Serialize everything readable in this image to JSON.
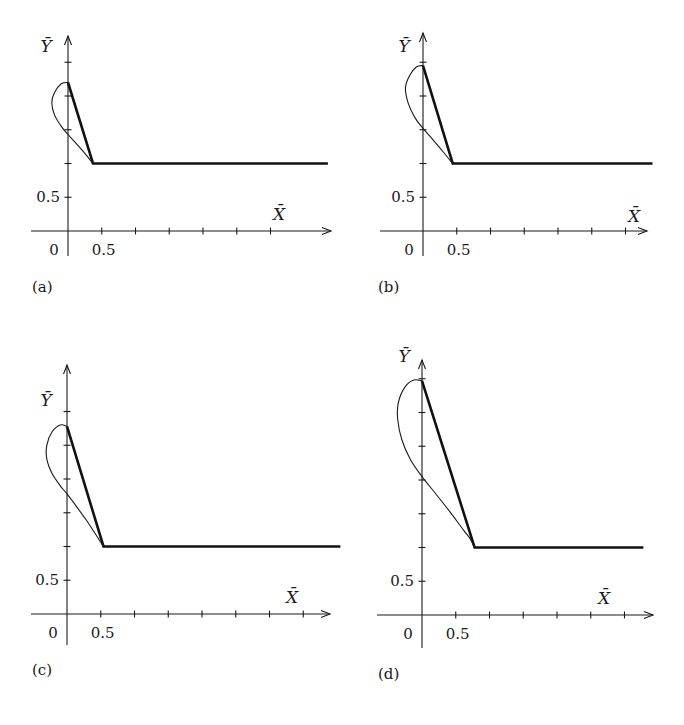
{
  "figure": {
    "panels_count": 4
  },
  "chart_data": [
    {
      "type": "line",
      "panel_label": "(a)",
      "xlabel": "X̄",
      "ylabel": "Ȳ",
      "x_tick_label": "0.5",
      "y_tick_label": "0.5",
      "origin_label": "0",
      "x_ticks": [
        0.5,
        1.0,
        1.5,
        2.0,
        2.5,
        3.0
      ],
      "y_ticks": [
        0.5,
        1.0,
        1.5,
        2.0,
        2.5
      ],
      "xlim": [
        -0.55,
        3.85
      ],
      "ylim": [
        -0.38,
        2.88
      ],
      "series": [
        {
          "name": "piecewise-linear (thick)",
          "points": [
            [
              0,
              2.2
            ],
            [
              0.37,
              1.0
            ],
            [
              3.85,
              1.0
            ]
          ]
        },
        {
          "name": "loop curve (thin)",
          "points": [
            [
              0,
              2.2
            ],
            [
              -0.1,
              2.18
            ],
            [
              -0.2,
              2.05
            ],
            [
              -0.24,
              1.9
            ],
            [
              -0.2,
              1.72
            ],
            [
              -0.1,
              1.55
            ],
            [
              0,
              1.43
            ],
            [
              0.12,
              1.3
            ],
            [
              0.25,
              1.15
            ],
            [
              0.37,
              1.0
            ]
          ]
        }
      ]
    },
    {
      "type": "line",
      "panel_label": "(b)",
      "xlabel": "X̄",
      "ylabel": "Ȳ",
      "x_tick_label": "0.5",
      "y_tick_label": "0.5",
      "origin_label": "0",
      "x_ticks": [
        0.5,
        1.0,
        1.5,
        2.0,
        2.5,
        3.0
      ],
      "y_ticks": [
        0.5,
        1.0,
        1.5,
        2.0,
        2.5
      ],
      "xlim": [
        -0.63,
        3.45
      ],
      "ylim": [
        -0.38,
        2.88
      ],
      "series": [
        {
          "name": "piecewise-linear (thick)",
          "points": [
            [
              0,
              2.45
            ],
            [
              0.44,
              1.0
            ],
            [
              3.4,
              1.0
            ]
          ]
        },
        {
          "name": "loop curve (thin)",
          "points": [
            [
              0,
              2.45
            ],
            [
              -0.1,
              2.43
            ],
            [
              -0.2,
              2.3
            ],
            [
              -0.26,
              2.12
            ],
            [
              -0.22,
              1.9
            ],
            [
              -0.12,
              1.68
            ],
            [
              0,
              1.52
            ],
            [
              0.15,
              1.35
            ],
            [
              0.3,
              1.17
            ],
            [
              0.44,
              1.0
            ]
          ]
        }
      ]
    },
    {
      "type": "line",
      "panel_label": "(c)",
      "xlabel": "X̄",
      "ylabel": "Ȳ",
      "x_tick_label": "0.5",
      "y_tick_label": "0.5",
      "origin_label": "0",
      "x_ticks": [
        0.5,
        1.0,
        1.5,
        2.0,
        2.5,
        3.0,
        3.5
      ],
      "y_ticks": [
        0.5,
        1.0,
        1.5,
        2.0,
        2.5,
        3.0
      ],
      "xlim": [
        -0.55,
        4.05
      ],
      "ylim": [
        -0.47,
        3.65
      ],
      "series": [
        {
          "name": "piecewise-linear (thick)",
          "points": [
            [
              0,
              2.78
            ],
            [
              0.54,
              1.0
            ],
            [
              4.05,
              1.0
            ]
          ]
        },
        {
          "name": "loop curve (thin)",
          "points": [
            [
              0,
              2.78
            ],
            [
              -0.1,
              2.8
            ],
            [
              -0.22,
              2.7
            ],
            [
              -0.3,
              2.5
            ],
            [
              -0.3,
              2.3
            ],
            [
              -0.22,
              2.08
            ],
            [
              -0.1,
              1.9
            ],
            [
              0,
              1.78
            ],
            [
              0.15,
              1.58
            ],
            [
              0.3,
              1.37
            ],
            [
              0.45,
              1.14
            ],
            [
              0.54,
              1.0
            ]
          ]
        }
      ]
    },
    {
      "type": "line",
      "panel_label": "(d)",
      "xlabel": "X̄",
      "ylabel": "Ȳ",
      "x_tick_label": "0.5",
      "y_tick_label": "0.5",
      "origin_label": "0",
      "x_ticks": [
        0.5,
        1.0,
        1.5,
        2.0,
        2.5,
        3.0
      ],
      "y_ticks": [
        0.5,
        1.0,
        1.5,
        2.0,
        2.5,
        3.0,
        3.5
      ],
      "xlim": [
        -0.65,
        3.4
      ],
      "ylim": [
        -0.5,
        3.7
      ],
      "series": [
        {
          "name": "piecewise-linear (thick)",
          "points": [
            [
              0,
              3.47
            ],
            [
              0.78,
              1.0
            ],
            [
              3.28,
              1.0
            ]
          ]
        },
        {
          "name": "loop curve (thin)",
          "points": [
            [
              0,
              3.47
            ],
            [
              -0.12,
              3.48
            ],
            [
              -0.25,
              3.38
            ],
            [
              -0.35,
              3.15
            ],
            [
              -0.36,
              2.9
            ],
            [
              -0.3,
              2.6
            ],
            [
              -0.17,
              2.3
            ],
            [
              0,
              2.05
            ],
            [
              0.2,
              1.8
            ],
            [
              0.42,
              1.52
            ],
            [
              0.62,
              1.25
            ],
            [
              0.7,
              1.15
            ],
            [
              0.78,
              1.0
            ]
          ]
        }
      ]
    }
  ]
}
